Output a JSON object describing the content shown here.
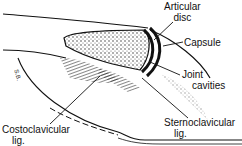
{
  "diagram": {
    "labels": {
      "articular_disc": [
        "Articular",
        "disc"
      ],
      "capsule": "Capsule",
      "joint_cavities": [
        "Joint",
        "cavities"
      ],
      "sternoclavicular_lig": [
        "Sternoclavicular",
        "lig."
      ],
      "costoclavicular_lig": [
        "Costoclavicular",
        "lig."
      ]
    },
    "signature": "S.B.",
    "colors": {
      "ink": "#111111",
      "background": "#ffffff"
    }
  }
}
